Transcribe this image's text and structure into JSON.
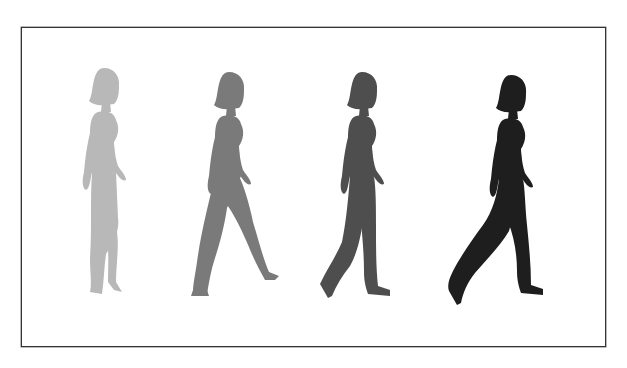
{
  "figure": {
    "figures": [
      {
        "label": "walker-1",
        "shade": "#b8b8b8"
      },
      {
        "label": "walker-2",
        "shade": "#7a7a7a"
      },
      {
        "label": "walker-3",
        "shade": "#4e4e4e"
      },
      {
        "label": "walker-4",
        "shade": "#1e1e1e"
      }
    ]
  }
}
